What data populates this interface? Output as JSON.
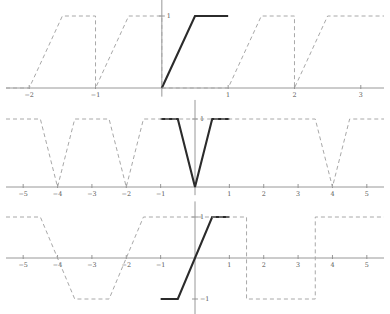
{
  "figure": {
    "title": "",
    "background_color": "#ffffff",
    "solid_color": "#2b2b2b",
    "dashed_color": "#a8a8a8",
    "axis_color": "#8c8c8c",
    "label_color": "#555555"
  },
  "chart_data": [
    {
      "id": "top",
      "type": "line",
      "title": "",
      "xlabel": "",
      "ylabel": "",
      "xlim": [
        -2.35,
        3.35
      ],
      "ylim": [
        -0.12,
        1.28
      ],
      "grid": false,
      "legend": "none",
      "xticks": [
        -2,
        -1,
        1,
        2,
        3
      ],
      "xtick_labels": [
        "−2",
        "−1",
        "1",
        "2",
        "3"
      ],
      "yticks": [
        1
      ],
      "ytick_labels": [
        "1"
      ],
      "description": "Periodic clipped ramp, period 1: rises linearly from 0 to 1 over half a period then holds at 1.",
      "series": [
        {
          "name": "principal-segment",
          "style": "solid",
          "color": "#2b2b2b",
          "x": [
            0,
            0.5,
            1
          ],
          "y": [
            0,
            1,
            1
          ]
        },
        {
          "name": "periodic-extension",
          "style": "dashed",
          "color": "#a8a8a8",
          "x": [
            -2.35,
            -2,
            -1.5,
            -1,
            -1,
            -0.5,
            0,
            0,
            1,
            1,
            1.5,
            2,
            2,
            2.5,
            3,
            3,
            3.35
          ],
          "y": [
            0,
            0,
            1,
            1,
            0,
            1,
            1,
            0,
            0,
            0,
            1,
            1,
            0,
            1,
            1,
            1,
            1
          ]
        }
      ]
    },
    {
      "id": "middle",
      "type": "line",
      "title": "",
      "xlabel": "",
      "ylabel": "",
      "xlim": [
        -5.5,
        5.5
      ],
      "ylim": [
        -0.12,
        1.28
      ],
      "grid": false,
      "legend": "none",
      "xticks": [
        -5,
        -4,
        -3,
        -2,
        -1,
        1,
        2,
        3,
        4,
        5
      ],
      "xtick_labels": [
        "−5",
        "−4",
        "−3",
        "−2",
        "−1",
        "1",
        "2",
        "3",
        "4",
        "5"
      ],
      "yticks": [
        1
      ],
      "ytick_labels": [
        "1"
      ],
      "description": "Periodic clipped triangle wave, period 4: flat at 1, dips linearly to 0 at even multiples of 2 and returns to 1.",
      "series": [
        {
          "name": "principal-segment",
          "style": "solid",
          "color": "#2b2b2b",
          "x": [
            -1,
            -0.5,
            0,
            0.5,
            1
          ],
          "y": [
            1,
            1,
            0,
            1,
            1
          ]
        },
        {
          "name": "periodic-extension",
          "style": "dashed",
          "color": "#a8a8a8",
          "x": [
            -5.5,
            -4.5,
            -4,
            -3.5,
            -2.5,
            -2,
            -1.5,
            -1,
            1,
            1.5,
            2.5,
            3.5,
            4,
            4.5,
            5.5
          ],
          "y": [
            1,
            1,
            0,
            1,
            1,
            0,
            1,
            1,
            1,
            1,
            1,
            1,
            0,
            1,
            1
          ]
        }
      ]
    },
    {
      "id": "bottom",
      "type": "line",
      "title": "",
      "xlabel": "",
      "ylabel": "",
      "xlim": [
        -5.5,
        5.5
      ],
      "ylim": [
        -1.38,
        1.38
      ],
      "grid": false,
      "legend": "none",
      "xticks": [
        -5,
        -4,
        -3,
        -2,
        -1,
        1,
        2,
        3,
        4,
        5
      ],
      "xtick_labels": [
        "−5",
        "−4",
        "−3",
        "−2",
        "−1",
        "1",
        "2",
        "3",
        "4",
        "5"
      ],
      "yticks": [
        1,
        -1
      ],
      "ytick_labels": [
        "1",
        "−1"
      ],
      "description": "Odd periodic clipped ramp, period 2: holds at -1, rises linearly through the origin to +1, then holds at 1.",
      "series": [
        {
          "name": "principal-segment",
          "style": "solid",
          "color": "#2b2b2b",
          "x": [
            -1,
            -0.5,
            0.5,
            1
          ],
          "y": [
            -1,
            -1,
            1,
            1
          ]
        },
        {
          "name": "periodic-extension",
          "style": "dashed",
          "color": "#a8a8a8",
          "x": [
            -5.5,
            -4.5,
            -3.5,
            -3,
            -2.5,
            -2.5,
            -1.5,
            -1,
            1,
            1.5,
            1.5,
            2.5,
            3,
            3.5,
            3.5,
            4.5,
            5,
            5.5
          ],
          "y": [
            1,
            1,
            -1,
            -1,
            -1,
            -1,
            1,
            1,
            1,
            1,
            -1,
            -1,
            -1,
            -1,
            1,
            1,
            1,
            1
          ]
        }
      ]
    }
  ]
}
